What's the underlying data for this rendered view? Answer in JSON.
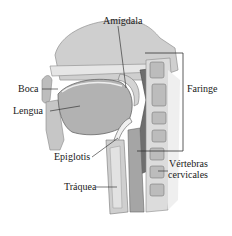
{
  "diagram": {
    "labels": {
      "amigdala": "Amígdala",
      "boca": "Boca",
      "lengua": "Lengua",
      "faringe": "Faringe",
      "epiglotis": "Epiglotis",
      "vertebras_line1": "Vértebras",
      "vertebras_line2": "cervicales",
      "traquea": "Tráquea"
    },
    "colors": {
      "tissue_light": "#d9d9d9",
      "tissue_mid": "#a8a8a8",
      "tissue_dark": "#5a5a5a",
      "line": "#222222"
    }
  }
}
